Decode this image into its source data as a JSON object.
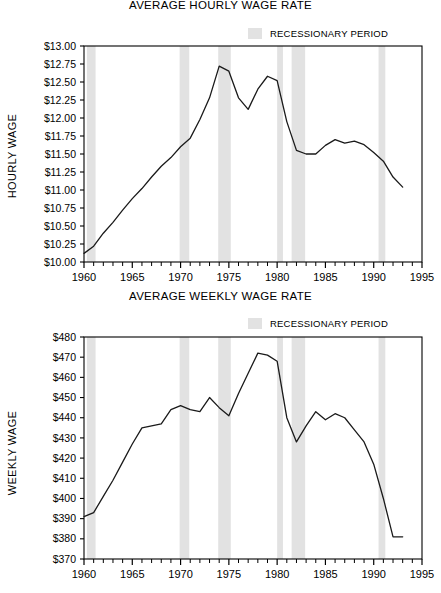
{
  "page": {
    "legend_label": "RECESSIONARY PERIOD",
    "legend_swatch_color": "#e2e2e2",
    "line_color": "#1a1a1a",
    "axis_color": "#000000",
    "background": "#ffffff"
  },
  "chart_data": [
    {
      "id": "hourly",
      "type": "line",
      "title": "AVERAGE HOURLY WAGE RATE",
      "xlabel": "",
      "ylabel": "HOURLY WAGE",
      "xlim": [
        1960,
        1995
      ],
      "ylim": [
        10.0,
        13.0
      ],
      "grid": false,
      "legend_position": "top-right",
      "legend": [
        "RECESSIONARY PERIOD"
      ],
      "ytick_labels": [
        "$13.00",
        "$12.75",
        "$12.50",
        "$12.25",
        "$12.00",
        "$11.75",
        "$11.50",
        "$11.25",
        "$11.00",
        "$10.75",
        "$10.50",
        "$10.25",
        "$10.00"
      ],
      "ytick_values": [
        13.0,
        12.75,
        12.5,
        12.25,
        12.0,
        11.75,
        11.5,
        11.25,
        11.0,
        10.75,
        10.5,
        10.25,
        10.0
      ],
      "xtick_labels": [
        "1960",
        "1965",
        "1970",
        "1975",
        "1980",
        "1985",
        "1990",
        "1995"
      ],
      "xtick_values": [
        1960,
        1965,
        1970,
        1975,
        1980,
        1985,
        1990,
        1995
      ],
      "xminor_step": 1,
      "x": [
        1960,
        1961,
        1962,
        1963,
        1964,
        1965,
        1966,
        1967,
        1968,
        1969,
        1970,
        1971,
        1972,
        1973,
        1974,
        1975,
        1976,
        1977,
        1978,
        1979,
        1980,
        1981,
        1982,
        1983,
        1984,
        1985,
        1986,
        1987,
        1988,
        1989,
        1990,
        1991,
        1992,
        1993
      ],
      "values": [
        10.12,
        10.22,
        10.4,
        10.55,
        10.72,
        10.88,
        11.02,
        11.18,
        11.33,
        11.45,
        11.6,
        11.72,
        11.98,
        12.28,
        12.72,
        12.65,
        12.28,
        12.12,
        12.4,
        12.58,
        12.52,
        11.95,
        11.55,
        11.5,
        11.5,
        11.62,
        11.7,
        11.65,
        11.68,
        11.63,
        11.52,
        11.4,
        11.18,
        11.04
      ],
      "recessions": [
        {
          "start": 1960.3,
          "end": 1961.2
        },
        {
          "start": 1969.9,
          "end": 1970.9
        },
        {
          "start": 1973.9,
          "end": 1975.2
        },
        {
          "start": 1980.0,
          "end": 1980.6
        },
        {
          "start": 1981.5,
          "end": 1982.9
        },
        {
          "start": 1990.5,
          "end": 1991.2
        }
      ]
    },
    {
      "id": "weekly",
      "type": "line",
      "title": "AVERAGE WEEKLY WAGE RATE",
      "xlabel": "",
      "ylabel": "WEEKLY WAGE",
      "xlim": [
        1960,
        1995
      ],
      "ylim": [
        370,
        480
      ],
      "grid": false,
      "legend_position": "top-right",
      "legend": [
        "RECESSIONARY PERIOD"
      ],
      "ytick_labels": [
        "$480",
        "$470",
        "$460",
        "$450",
        "$440",
        "$430",
        "$420",
        "$410",
        "$400",
        "$390",
        "$380",
        "$370"
      ],
      "ytick_values": [
        480,
        470,
        460,
        450,
        440,
        430,
        420,
        410,
        400,
        390,
        380,
        370
      ],
      "xtick_labels": [
        "1960",
        "1965",
        "1970",
        "1975",
        "1980",
        "1985",
        "1990",
        "1995"
      ],
      "xtick_values": [
        1960,
        1965,
        1970,
        1975,
        1980,
        1985,
        1990,
        1995
      ],
      "xminor_step": 1,
      "x": [
        1960,
        1961,
        1962,
        1963,
        1964,
        1965,
        1966,
        1967,
        1968,
        1969,
        1970,
        1971,
        1972,
        1973,
        1974,
        1975,
        1976,
        1977,
        1978,
        1979,
        1980,
        1981,
        1982,
        1983,
        1984,
        1985,
        1986,
        1987,
        1988,
        1989,
        1990,
        1991,
        1992,
        1993
      ],
      "values": [
        391,
        393,
        401,
        409,
        418,
        427,
        435,
        436,
        437,
        444,
        446,
        444,
        443,
        450,
        445,
        441,
        452,
        462,
        472,
        471,
        468,
        440,
        428,
        436,
        443,
        439,
        442,
        440,
        434,
        428,
        417,
        400,
        381,
        381
      ],
      "recessions": [
        {
          "start": 1960.3,
          "end": 1961.2
        },
        {
          "start": 1969.9,
          "end": 1970.9
        },
        {
          "start": 1973.9,
          "end": 1975.2
        },
        {
          "start": 1980.0,
          "end": 1980.6
        },
        {
          "start": 1981.5,
          "end": 1982.9
        },
        {
          "start": 1990.5,
          "end": 1991.2
        }
      ]
    }
  ]
}
